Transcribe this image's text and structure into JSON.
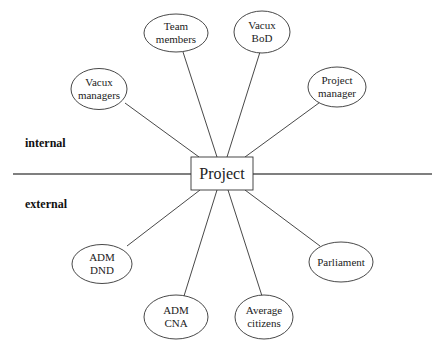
{
  "diagram": {
    "center": {
      "label": "Project"
    },
    "zones": {
      "internal": "internal",
      "external": "external"
    },
    "nodes": [
      {
        "id": "vacux-managers",
        "zone": "internal",
        "lines": [
          "Vacux",
          "managers"
        ]
      },
      {
        "id": "team-members",
        "zone": "internal",
        "lines": [
          "Team",
          "members"
        ]
      },
      {
        "id": "vacux-bod",
        "zone": "internal",
        "lines": [
          "Vacux",
          "BoD"
        ]
      },
      {
        "id": "project-manager",
        "zone": "internal",
        "lines": [
          "Project",
          "manager"
        ]
      },
      {
        "id": "adm-dnd",
        "zone": "external",
        "lines": [
          "ADM",
          "DND"
        ]
      },
      {
        "id": "adm-cna",
        "zone": "external",
        "lines": [
          "ADM",
          "CNA"
        ]
      },
      {
        "id": "average-citizens",
        "zone": "external",
        "lines": [
          "Average",
          "citizens"
        ]
      },
      {
        "id": "parliament",
        "zone": "external",
        "lines": [
          "Parliament"
        ]
      }
    ]
  }
}
